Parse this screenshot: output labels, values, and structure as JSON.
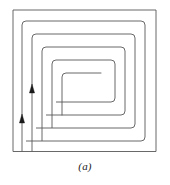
{
  "figure": {
    "caption": "(a)",
    "kind": "square-spiral-diagram",
    "background_color": "#ffffff",
    "stroke_color": "#585858",
    "arrow_color": "#1a1a1a",
    "stroke_width": 0.9,
    "arrow_count": 2,
    "arrow_direction": "up",
    "spiral_turns": 4,
    "spiral_corner_style": "rounded",
    "outer_square": {
      "left": 13,
      "top": 10,
      "right": 156,
      "bottom": 152
    },
    "arrows": [
      {
        "name": "inner-flow-arrow",
        "x": 32,
        "y": 90,
        "direction": "up"
      },
      {
        "name": "outer-flow-arrow",
        "x": 22,
        "y": 120,
        "direction": "up"
      }
    ],
    "paths": {
      "turn_1_outer": "M 13 152 L 13 10 L 156 10 L 156 152 L 32 152",
      "turn_2": "M 22 152 L 22 22 L 144 22 L 144 140 L 42 140",
      "turn_3": "M 32 152 L 32 34 L 132 34 L 132 128 L 52 128",
      "turn_4": "M 42 140 L 42 46 L 120 46 L 120 116 L 62 116",
      "turn_5_inner": "M 52 128 L 52 58 L 108 58 L 108 104 L 72 104",
      "terminus": "M 62 116 L 62 70 L 96 70"
    }
  }
}
